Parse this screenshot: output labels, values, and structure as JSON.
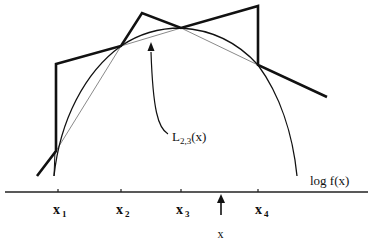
{
  "diagram": {
    "title": "",
    "colors": {
      "background": "#ffffff",
      "ink": "#111111",
      "chord": "#8a8a8a"
    },
    "axis": {
      "y": 192,
      "x_start": 5,
      "x_end": 368,
      "ticks": [
        {
          "id": "x1",
          "x": 58,
          "label_main": "x",
          "label_sub": "1"
        },
        {
          "id": "x2",
          "x": 121,
          "label_main": "x",
          "label_sub": "2"
        },
        {
          "id": "x3",
          "x": 181,
          "label_main": "x",
          "label_sub": "3"
        },
        {
          "id": "x4",
          "x": 258,
          "label_main": "x",
          "label_sub": "4"
        }
      ]
    },
    "query_point": {
      "label": "x",
      "x": 221,
      "arrow_from_y": 215,
      "arrow_to_y": 194
    },
    "curve": {
      "name": "log-density",
      "label": "log f(x)",
      "label_pos": [
        300,
        183
      ]
    },
    "upper_hull": {
      "name": "piecewise-linear-upper-envelope",
      "points": [
        [
          37,
          176
        ],
        [
          56,
          151
        ],
        [
          56,
          64
        ],
        [
          121,
          46
        ],
        [
          142,
          13
        ],
        [
          181,
          28
        ],
        [
          258,
          6
        ],
        [
          258,
          65
        ],
        [
          327,
          97
        ]
      ]
    },
    "lower_hull": {
      "name": "chord-lower-squeeze",
      "points": [
        [
          56,
          151
        ],
        [
          121,
          46
        ],
        [
          181,
          28
        ],
        [
          258,
          65
        ]
      ]
    },
    "chord_annotation": {
      "label_main": "L",
      "label_sub": "2,3",
      "label_suffix": "(x)",
      "label_pos": [
        165,
        138
      ],
      "arrow_target": [
        150,
        42
      ]
    }
  }
}
